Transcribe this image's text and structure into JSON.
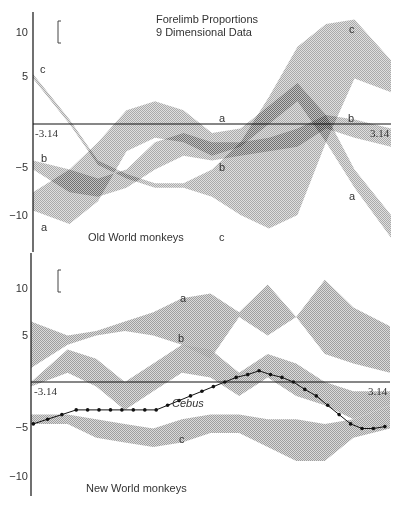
{
  "chart_data": [
    {
      "type": "area",
      "title": "Forelimb Proportions",
      "subtitle": "9 Dimensional Data",
      "panel_label": "Old World monkeys",
      "xlabel": "",
      "ylabel": "",
      "xlim": [
        -3.14,
        3.14
      ],
      "ylim": [
        -13,
        12
      ],
      "x_tick_labels": [
        "-3.14",
        "3.14"
      ],
      "y_ticks": [
        10,
        5,
        -5,
        -10
      ],
      "y_tick_labels": [
        "10",
        "5",
        "−5",
        "−10"
      ],
      "grid": false,
      "legend": "none (bands labeled inline a, b, c)",
      "scale_bar": true,
      "description": "Andrews-curve style bands for three groups; overlapping regions are darker",
      "x": [
        -3.14,
        -2.5,
        -2.0,
        -1.5,
        -1.0,
        -0.5,
        0.0,
        0.5,
        1.0,
        1.5,
        2.0,
        2.5,
        3.14
      ],
      "series": [
        {
          "name": "a",
          "upper": [
            -7.5,
            -5.0,
            -2.0,
            1.5,
            2.5,
            1.5,
            -1.0,
            -0.5,
            2.0,
            4.5,
            1.0,
            -5.0,
            -10.0
          ],
          "lower": [
            -9.5,
            -11.0,
            -8.5,
            -3.0,
            -1.5,
            -2.0,
            -3.5,
            -2.5,
            0.0,
            2.5,
            -2.0,
            -7.0,
            -12.5
          ]
        },
        {
          "name": "b",
          "upper": [
            -4.0,
            -5.0,
            -6.0,
            -5.0,
            -2.0,
            -1.0,
            -2.0,
            -2.0,
            -1.5,
            -0.5,
            1.0,
            0.5,
            -0.5
          ],
          "lower": [
            -5.0,
            -7.5,
            -8.0,
            -7.0,
            -5.0,
            -3.5,
            -4.0,
            -3.5,
            -3.0,
            -2.5,
            -0.5,
            -1.5,
            -2.5
          ]
        },
        {
          "name": "c",
          "upper": [
            5.5,
            0.5,
            -4.0,
            -5.5,
            -6.5,
            -6.5,
            -5.0,
            -2.0,
            3.0,
            8.5,
            11.0,
            11.5,
            7.0
          ],
          "lower": [
            5.0,
            0.0,
            -4.5,
            -6.0,
            -7.0,
            -7.0,
            -8.0,
            -10.0,
            -11.5,
            -10.0,
            -2.0,
            5.0,
            3.5
          ]
        }
      ],
      "labels": [
        {
          "text": "a",
          "x": 0.6,
          "y": 0.5
        },
        {
          "text": "a",
          "x": -3.0,
          "y": -11.0
        },
        {
          "text": "a",
          "x": 2.7,
          "y": -7.0
        },
        {
          "text": "b",
          "x": -3.0,
          "y": -3.8
        },
        {
          "text": "b",
          "x": 0.5,
          "y": -4.0
        },
        {
          "text": "b",
          "x": 2.6,
          "y": 0.8
        },
        {
          "text": "c",
          "x": -2.9,
          "y": 6.2
        },
        {
          "text": "c",
          "x": 0.4,
          "y": -13.0
        },
        {
          "text": "c",
          "x": 2.5,
          "y": 12.5
        }
      ]
    },
    {
      "type": "area",
      "title": "",
      "panel_label": "New World monkeys",
      "xlabel": "",
      "ylabel": "",
      "xlim": [
        -3.14,
        3.14
      ],
      "ylim": [
        -12,
        14
      ],
      "x_tick_labels": [
        "-3.14",
        "3.14"
      ],
      "y_ticks": [
        10,
        5,
        -5,
        -10
      ],
      "y_tick_labels": [
        "10",
        "5",
        "−5",
        "−10"
      ],
      "grid": false,
      "legend": "none (bands labeled inline a, b, c; line labeled Cebus)",
      "scale_bar": true,
      "x": [
        -3.14,
        -2.5,
        -2.0,
        -1.5,
        -1.0,
        -0.5,
        0.0,
        0.5,
        1.0,
        1.5,
        2.0,
        2.5,
        3.14
      ],
      "series": [
        {
          "name": "a",
          "upper": [
            6.5,
            5.0,
            5.5,
            6.5,
            7.5,
            9.0,
            9.5,
            7.5,
            10.5,
            7.0,
            11.0,
            8.0,
            6.0
          ],
          "lower": [
            1.5,
            4.0,
            5.0,
            5.5,
            5.0,
            4.0,
            2.5,
            7.0,
            5.0,
            7.0,
            3.0,
            2.0,
            1.0
          ]
        },
        {
          "name": "b",
          "upper": [
            0.0,
            3.5,
            2.5,
            0.0,
            2.0,
            4.0,
            3.5,
            1.0,
            3.0,
            2.0,
            0.0,
            -1.0,
            -1.0
          ],
          "lower": [
            -0.5,
            1.0,
            -0.5,
            -3.0,
            -1.0,
            1.0,
            0.5,
            -1.5,
            0.5,
            -1.5,
            -2.5,
            -4.0,
            -2.5
          ]
        },
        {
          "name": "c",
          "upper": [
            -3.5,
            -3.5,
            -4.0,
            -4.5,
            -5.0,
            -4.0,
            -3.5,
            -3.5,
            -4.0,
            -4.0,
            -4.5,
            -4.0,
            -2.5
          ],
          "lower": [
            -4.5,
            -4.5,
            -6.0,
            -6.5,
            -7.0,
            -6.5,
            -5.5,
            -5.5,
            -7.0,
            -8.5,
            -8.5,
            -6.0,
            -5.0
          ]
        }
      ],
      "line_series": {
        "name": "Cebus",
        "marker": "dot",
        "x": [
          -3.1,
          -2.85,
          -2.6,
          -2.35,
          -2.15,
          -1.95,
          -1.75,
          -1.55,
          -1.35,
          -1.15,
          -0.95,
          -0.75,
          -0.55,
          -0.35,
          -0.15,
          0.05,
          0.25,
          0.45,
          0.65,
          0.85,
          1.05,
          1.25,
          1.45,
          1.65,
          1.85,
          2.05,
          2.25,
          2.45,
          2.65,
          2.85,
          3.05
        ],
        "y": [
          -4.5,
          -4.0,
          -3.5,
          -3.0,
          -3.0,
          -3.0,
          -3.0,
          -3.0,
          -3.0,
          -3.0,
          -3.0,
          -2.5,
          -2.0,
          -1.5,
          -1.0,
          -0.5,
          0.0,
          0.5,
          0.8,
          1.2,
          0.8,
          0.5,
          0.0,
          -0.8,
          -1.5,
          -2.5,
          -3.5,
          -4.5,
          -5.0,
          -5.0,
          -4.8
        ]
      },
      "labels": [
        {
          "text": "a",
          "x": -0.5,
          "y": 9.0
        },
        {
          "text": "b",
          "x": -0.5,
          "y": 6.5
        },
        {
          "text": "c",
          "x": -0.3,
          "y": -6.0
        },
        {
          "text": "Cebus",
          "x": -0.7,
          "y": -2.5
        }
      ]
    }
  ],
  "figure": {
    "title_line1": "Forelimb Proportions",
    "title_line2": "9 Dimensional Data",
    "top_panel_label": "Old World monkeys",
    "bottom_panel_label": "New World monkeys",
    "x_min_label": "-3.14",
    "x_max_label": "3.14",
    "y_tick_10": "10",
    "y_tick_5": "5",
    "y_tick_m5": "−5",
    "y_tick_m10": "−10",
    "band_label_a": "a",
    "band_label_b": "b",
    "band_label_c": "c",
    "cebus_label": "Cebus",
    "colors": {
      "band": "#9a9a9a",
      "band_light": "#c8c8c8",
      "overlap": "#3a3a3a",
      "axis": "#111111",
      "text": "#333333",
      "line": "#111111"
    }
  }
}
